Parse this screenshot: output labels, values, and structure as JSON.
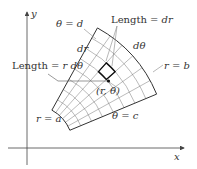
{
  "diagram": {
    "type": "polar-rectangle-grid",
    "axes": {
      "x_label": "x",
      "y_label": "y"
    },
    "labels": {
      "theta_d": "θ = d",
      "theta_c": "θ = c",
      "r_a": "r = a",
      "r_b": "r = b",
      "dr": "dr",
      "dtheta": "dθ",
      "length_dr": "Length = dr",
      "length_rdtheta": "Length = r dθ",
      "point": "(r, θ)"
    },
    "geometry": {
      "center": [
        32,
        146
      ],
      "r_inner": 41,
      "r_outer": 135,
      "theta_c_deg": 22.6,
      "theta_d_deg": 61,
      "radial_divisions": 8,
      "angular_divisions": 6
    },
    "colors": {
      "stroke": "#333333",
      "grid": "#555555",
      "leader": "#888888"
    }
  }
}
